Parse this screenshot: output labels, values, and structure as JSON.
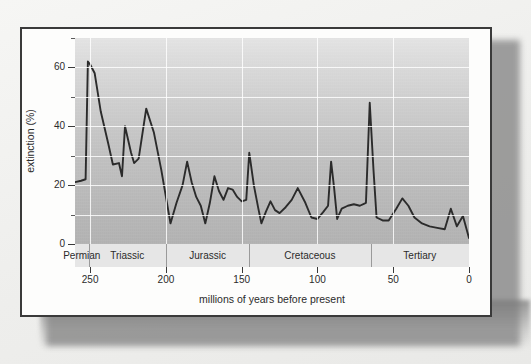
{
  "figure": {
    "card_background": "#fdfdfc",
    "border_color": "#3a3a3a"
  },
  "chart_data": {
    "type": "line",
    "title": "",
    "subtitle": "",
    "xlabel": "millions of years before present",
    "ylabel": "extinction (%)",
    "xlim": [
      260,
      0
    ],
    "ylim": [
      0,
      70
    ],
    "x_axis_reversed": true,
    "grid": true,
    "legend_position": "none",
    "x_ticks_major": [
      250,
      200,
      150,
      100,
      50,
      0
    ],
    "x_tick_labels": [
      "250",
      "200",
      "150",
      "100",
      "50",
      "0"
    ],
    "y_ticks_major": [
      0,
      20,
      40,
      60
    ],
    "y_tick_labels": [
      "0",
      "20",
      "40",
      "60"
    ],
    "y_ticks_minor": [
      10,
      30,
      50,
      70
    ],
    "line_color": "#2b2b2b",
    "series": [
      {
        "name": "extinction rate",
        "points": [
          [
            260,
            21.0
          ],
          [
            256,
            21.5
          ],
          [
            253,
            22.0
          ],
          [
            251.5,
            62.0
          ],
          [
            250,
            61.0
          ],
          [
            247,
            58.0
          ],
          [
            243,
            45.0
          ],
          [
            238,
            34.0
          ],
          [
            235,
            27.0
          ],
          [
            231,
            27.5
          ],
          [
            229,
            23.0
          ],
          [
            227,
            40.0
          ],
          [
            223,
            31.0
          ],
          [
            221,
            27.5
          ],
          [
            218,
            29.0
          ],
          [
            213,
            46.0
          ],
          [
            208,
            38.0
          ],
          [
            203,
            25.0
          ],
          [
            197,
            7.0
          ],
          [
            193,
            14.0
          ],
          [
            189,
            20.0
          ],
          [
            186,
            28.0
          ],
          [
            183,
            21.0
          ],
          [
            180,
            16.0
          ],
          [
            177,
            13.0
          ],
          [
            174,
            7.0
          ],
          [
            171,
            14.0
          ],
          [
            168,
            23.0
          ],
          [
            165,
            18.0
          ],
          [
            162,
            15.0
          ],
          [
            159,
            19.0
          ],
          [
            156,
            18.5
          ],
          [
            153,
            16.0
          ],
          [
            150,
            14.5
          ],
          [
            147,
            15.0
          ],
          [
            145,
            31.0
          ],
          [
            142,
            20.0
          ],
          [
            139,
            12.0
          ],
          [
            137,
            7.0
          ],
          [
            134,
            11.0
          ],
          [
            131,
            14.5
          ],
          [
            128,
            11.5
          ],
          [
            125,
            10.5
          ],
          [
            121,
            12.5
          ],
          [
            117,
            15.0
          ],
          [
            113,
            19.0
          ],
          [
            108,
            14.0
          ],
          [
            104,
            9.0
          ],
          [
            100,
            8.5
          ],
          [
            96,
            11.0
          ],
          [
            93,
            13.0
          ],
          [
            91,
            28.0
          ],
          [
            89,
            19.0
          ],
          [
            87,
            8.5
          ],
          [
            84,
            12.0
          ],
          [
            80,
            13.0
          ],
          [
            76,
            13.5
          ],
          [
            72,
            13.0
          ],
          [
            68,
            14.0
          ],
          [
            65.5,
            48.0
          ],
          [
            63,
            25.0
          ],
          [
            61,
            9.0
          ],
          [
            57,
            8.0
          ],
          [
            53,
            8.0
          ],
          [
            48,
            12.0
          ],
          [
            44,
            15.5
          ],
          [
            40,
            13.0
          ],
          [
            36,
            9.0
          ],
          [
            31,
            7.0
          ],
          [
            26,
            6.0
          ],
          [
            21,
            5.5
          ],
          [
            16,
            5.0
          ],
          [
            12,
            12.0
          ],
          [
            8,
            6.0
          ],
          [
            4,
            9.5
          ],
          [
            0,
            2.0
          ]
        ]
      }
    ],
    "period_bands": [
      {
        "label": "Permian",
        "start": 260,
        "end": 251
      },
      {
        "label": "Triassic",
        "start": 251,
        "end": 200
      },
      {
        "label": "Jurassic",
        "start": 200,
        "end": 145
      },
      {
        "label": "Cretaceous",
        "start": 145,
        "end": 65
      },
      {
        "label": "Tertiary",
        "start": 65,
        "end": 0
      }
    ]
  }
}
